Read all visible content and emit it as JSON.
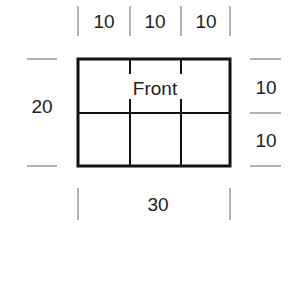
{
  "diagram": {
    "panel_label": "Front",
    "width_total": "30",
    "height_total": "20",
    "column_widths": [
      "10",
      "10",
      "10"
    ],
    "row_heights": [
      "10",
      "10"
    ],
    "colors": {
      "outline": "#111111",
      "dimension_lines": "#8a8a8a",
      "text": "#222222",
      "background": "#ffffff"
    }
  }
}
